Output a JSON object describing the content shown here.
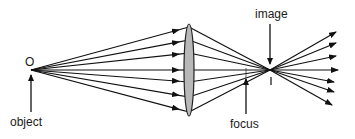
{
  "diagram": {
    "labels": {
      "object_point": "O",
      "object": "object",
      "image": "image",
      "focus": "focus"
    },
    "colors": {
      "ray": "#111111",
      "lens_fill": "#b8b8b8",
      "lens_stroke": "#222222",
      "text": "#1a1a1a",
      "background": "#ffffff"
    },
    "geometry": {
      "object_point": [
        31,
        70
      ],
      "lens_center_x": 189,
      "lens_top": 24,
      "lens_bottom": 116,
      "lens_half_width": 5,
      "image_point": [
        270,
        70
      ],
      "incoming_ray_ends_y": [
        27,
        40,
        53,
        70,
        82,
        97,
        112
      ],
      "outgoing_ray_ends": [
        [
          336,
          32
        ],
        [
          336,
          43
        ],
        [
          336,
          56
        ],
        [
          338,
          70
        ],
        [
          334,
          82
        ],
        [
          334,
          92
        ],
        [
          332,
          105
        ]
      ],
      "focus_x": 246
    },
    "ray_count": 7
  }
}
